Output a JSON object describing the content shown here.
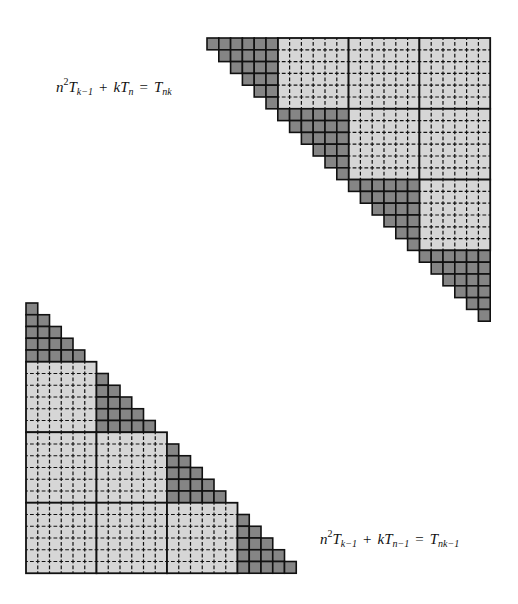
{
  "colors": {
    "dark": "#858585",
    "light": "#d6d6d6",
    "line": "#111111",
    "background": "#ffffff"
  },
  "figures": [
    {
      "id": "upper-triangle",
      "orientation": "upper",
      "origin": [
        207,
        38
      ],
      "cell": 11.8,
      "block_size": 6,
      "blocks": 4,
      "diagonal_block_shape": "T6 (row widths 6..1)",
      "formula": {
        "parts": [
          "n",
          "2",
          "T",
          "k−1",
          "+",
          "k",
          "T",
          "n",
          "=",
          "T",
          "nk"
        ],
        "text": "n²T_{k−1} + kT_n = T_{nk}"
      }
    },
    {
      "id": "lower-triangle",
      "orientation": "lower",
      "origin": [
        26,
        303
      ],
      "cell": 11.75,
      "block_size": 6,
      "blocks": 4,
      "diagonal_block_shape": "T5 (row widths 1..5)",
      "formula": {
        "parts": [
          "n",
          "2",
          "T",
          "k−1",
          "+",
          "k",
          "T",
          "n−1",
          "=",
          "T",
          "nk−1"
        ],
        "text": "n²T_{k−1} + kT_{n−1} = T_{nk−1}"
      }
    }
  ]
}
